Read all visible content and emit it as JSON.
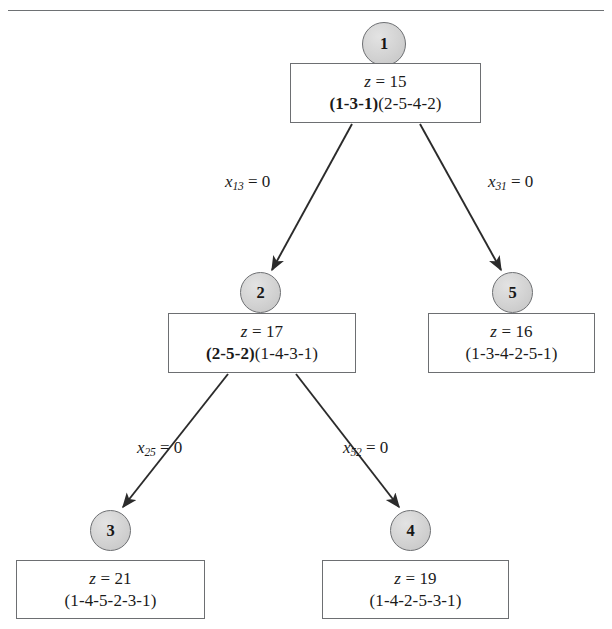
{
  "figure": {
    "top_rule": true
  },
  "nodes": [
    {
      "id": "1",
      "label": "1",
      "z_prefix": "z",
      "z_eq": " = ",
      "z_value": "15",
      "line1": "z = 15",
      "bold_part": "(1-3-1)",
      "plain_part": "(2-5-4-2)",
      "line2": "(1-3-1)(2-5-4-2)"
    },
    {
      "id": "2",
      "label": "2",
      "z_prefix": "z",
      "z_eq": " = ",
      "z_value": "17",
      "line1": "z = 17",
      "bold_part": "(2-5-2)",
      "plain_part": "(1-4-3-1)",
      "line2": "(2-5-2)(1-4-3-1)"
    },
    {
      "id": "5",
      "label": "5",
      "z_prefix": "z",
      "z_eq": " = ",
      "z_value": "16",
      "line1": "z = 16",
      "bold_part": "",
      "plain_part": "(1-3-4-2-5-1)",
      "line2": "(1-3-4-2-5-1)"
    },
    {
      "id": "3",
      "label": "3",
      "z_prefix": "z",
      "z_eq": " = ",
      "z_value": "21",
      "line1": "z = 21",
      "bold_part": "",
      "plain_part": "(1-4-5-2-3-1)",
      "line2": "(1-4-5-2-3-1)"
    },
    {
      "id": "4",
      "label": "4",
      "z_prefix": "z",
      "z_eq": " = ",
      "z_value": "19",
      "line1": "z = 19",
      "bold_part": "",
      "plain_part": "(1-4-2-5-3-1)",
      "line2": "(1-4-2-5-3-1)"
    }
  ],
  "edges": [
    {
      "from": "1",
      "to": "2",
      "var": "x",
      "sub": "13",
      "eq": " = 0",
      "text": "x13 = 0"
    },
    {
      "from": "1",
      "to": "5",
      "var": "x",
      "sub": "31",
      "eq": " = 0",
      "text": "x31 = 0"
    },
    {
      "from": "2",
      "to": "3",
      "var": "x",
      "sub": "25",
      "eq": " = 0",
      "text": "x25 = 0"
    },
    {
      "from": "2",
      "to": "4",
      "var": "x",
      "sub": "52",
      "eq": " = 0",
      "text": "x52 = 0"
    }
  ],
  "colors": {
    "node_fill": "#d2d2d2",
    "stroke": "#6d6f72",
    "edge_line": "#2b2b2b",
    "text": "#171717",
    "background": "#ffffff"
  }
}
